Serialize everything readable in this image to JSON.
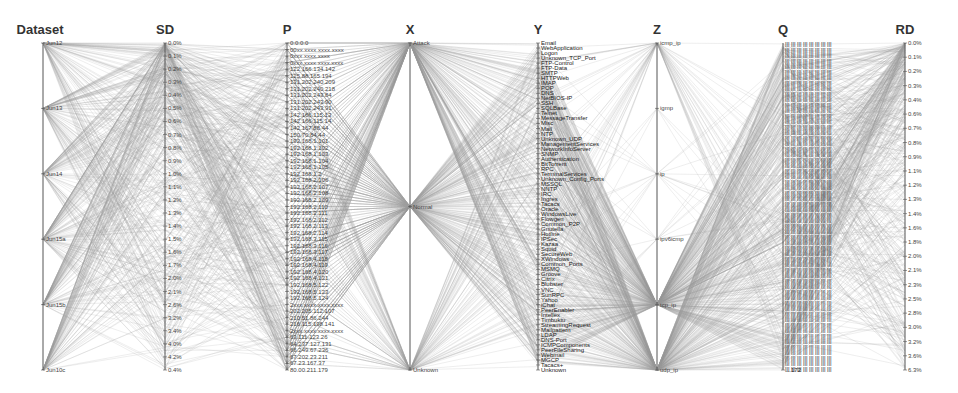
{
  "chart_data": {
    "type": "parallel-coordinates",
    "title": "",
    "grid": false,
    "legend": null,
    "axes": [
      {
        "name": "Dataset",
        "x": 43,
        "ticks": [
          "Jun12",
          "Jun13",
          "Jun14",
          "Jun15a",
          "Jun15b",
          "Jun10c"
        ]
      },
      {
        "name": "SD",
        "x": 165,
        "ticks": [
          "0.0%",
          "0.1%",
          "0.2%",
          "0.3%",
          "0.4%",
          "0.5%",
          "0.6%",
          "0.7%",
          "0.8%",
          "0.9%",
          "1.0%",
          "1.1%",
          "1.2%",
          "1.3%",
          "1.4%",
          "1.5%",
          "1.6%",
          "1.7%",
          "2.0%",
          "2.1%",
          "2.6%",
          "3.2%",
          "3.4%",
          "4.0%",
          "4.2%",
          "0.4%"
        ]
      },
      {
        "name": "P",
        "x": 287,
        "ticks": [
          "0.0.0.0",
          "00xx.xxxx.xxxx.xxxx",
          "0xxx.xxxx.xxxx",
          "0xxx.xxxx.xxxx.xxxx",
          "122.166.134.142",
          "125.88.165.194",
          "131.202.240.209",
          "131.202.240.218",
          "131.202.243.84",
          "131.202.243.90",
          "131.202.243.91",
          "142.166.115.13",
          "142.166.115.14",
          "142.167.88.44",
          "150.70.84.44",
          "192.168.1.101",
          "192.168.1.102",
          "192.168.1.103",
          "192.168.1.104",
          "192.168.1.105",
          "192.168.1.2",
          "192.168.2.106",
          "192.168.2.107",
          "192.168.2.108",
          "192.168.2.109",
          "192.168.2.110",
          "192.168.2.111",
          "192.168.2.112",
          "192.168.2.113",
          "192.168.2.114",
          "192.168.3.115",
          "192.168.3.116",
          "192.168.3.117",
          "192.168.4.118",
          "192.168.4.119",
          "192.168.4.120",
          "192.168.4.121",
          "192.168.5.122",
          "192.168.5.123",
          "192.168.5.124",
          "2xxx.xxxx.xxxx.xxxx",
          "202.205.112.107",
          "210.51.86.244",
          "216.115.198.141",
          "2xxx.xxxx.xxxx.xxxx",
          "63.111.123.26",
          "64.237.127.131",
          "66.249.67.236",
          "67.202.23.211",
          "67.23.167.37",
          "80.00.211.179"
        ]
      },
      {
        "name": "X",
        "x": 410,
        "ticks": [
          "Attack",
          "Normal",
          "Unknown"
        ]
      },
      {
        "name": "Y",
        "x": 538,
        "ticks": [
          "Email",
          "WebApplication",
          "Logon",
          "Unknown_TCP_Port",
          "FTP-Control",
          "FTP-Data",
          "SMTP",
          "HTTPWeb",
          "IMAP",
          "POP",
          "DNS",
          "NetBIOS-IP",
          "SSH",
          "SQLBase",
          "Telnet",
          "MessageTransfer",
          "Misc",
          "Mail",
          "NTP",
          "Unknown_UDP",
          "ManagementServices",
          "NetworkInfoServer",
          "SNMP",
          "Authentication",
          "BitTorrent",
          "RPC",
          "TerminalServices",
          "Unknown_Config_Ports",
          "MSSQL",
          "NNTP",
          "IRC",
          "Ingres",
          "Tacacs",
          "Oracle",
          "WindowsLive",
          "Flowgen",
          "Common_P2P",
          "Gnutella",
          "Hotline",
          "IPSec",
          "Kazaa",
          "Squid",
          "SecureWeb",
          "XWindows",
          "Common_Ports",
          "MSMQ",
          "Groove",
          "Citrix",
          "Blubster",
          "VNC",
          "SunRPC",
          "Yahoo",
          "iChat",
          "PeerEnabler",
          "Intellex",
          "Timbuktu",
          "StreamingRequest",
          "Mailpattern",
          "LDAP",
          "DNS-Port",
          "ICMPComponents",
          "PeerFileSharing",
          "Webmail",
          "MGCP",
          "Tacacs+",
          "Unknown"
        ]
      },
      {
        "name": "Z",
        "x": 657,
        "ticks": [
          "icmp_ip",
          "igmp",
          "ip",
          "ipv6icmp",
          "tcp_ip",
          "udp_ip"
        ]
      },
      {
        "name": "Q",
        "x": 783,
        "ticks_note": "dense overlapping port/address labels (illegible)",
        "ticks": [
          "...172"
        ]
      },
      {
        "name": "RD",
        "x": 905,
        "ticks": [
          "0.0%",
          "0.1%",
          "0.2%",
          "0.3%",
          "0.4%",
          "0.6%",
          "0.7%",
          "0.8%",
          "0.9%",
          "1.1%",
          "1.2%",
          "1.3%",
          "1.4%",
          "1.6%",
          "1.8%",
          "2.0%",
          "2.1%",
          "2.3%",
          "2.5%",
          "2.8%",
          "3.0%",
          "3.2%",
          "3.6%",
          "6.3%"
        ]
      }
    ],
    "axis_range_px": [
      43,
      370
    ],
    "line_color": "#9a9a9a",
    "axis_color": "#555555"
  }
}
